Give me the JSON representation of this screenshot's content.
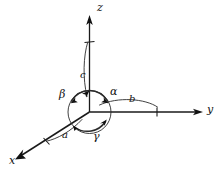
{
  "figure": {
    "background_color": "#ffffff",
    "line_color": "#1a1a1a",
    "width": 220,
    "height": 169
  },
  "axes": [
    {
      "id": "z",
      "label": "z",
      "direction": "up",
      "parameter_label": "c",
      "tick_present": true
    },
    {
      "id": "y",
      "label": "y",
      "direction": "right",
      "parameter_label": "b",
      "tick_present": true
    },
    {
      "id": "x",
      "label": "x",
      "direction": "down-left",
      "parameter_label": "a",
      "tick_present": true
    }
  ],
  "angles": [
    {
      "id": "alpha",
      "label": "α",
      "between": "b and c"
    },
    {
      "id": "beta",
      "label": "β",
      "between": "a and c"
    },
    {
      "id": "gamma",
      "label": "γ",
      "between": "a and b"
    }
  ],
  "labels": {
    "axis_z": "z",
    "axis_y": "y",
    "axis_x": "x",
    "param_c": "c",
    "param_b": "b",
    "param_a": "a",
    "angle_alpha": "α",
    "angle_beta": "β",
    "angle_gamma": "γ"
  }
}
